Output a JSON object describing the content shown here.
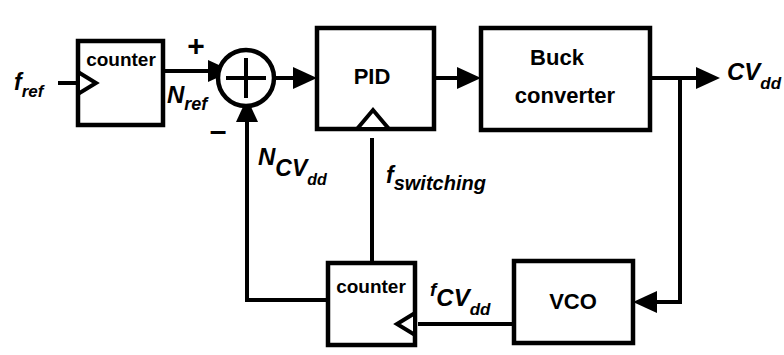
{
  "diagram": {
    "stroke_color": "#000000",
    "background_color": "#ffffff",
    "blocks": [
      {
        "id": "counter_ref",
        "label": "counter",
        "x": 78,
        "y": 41,
        "w": 85,
        "h": 84
      },
      {
        "id": "pid",
        "label": "PID",
        "x": 317,
        "y": 28,
        "w": 117,
        "h": 101
      },
      {
        "id": "buck",
        "label_line1": "Buck",
        "label_line2": "converter",
        "x": 481,
        "y": 28,
        "w": 169,
        "h": 102
      },
      {
        "id": "counter_fb",
        "label": "counter",
        "x": 328,
        "y": 263,
        "w": 87,
        "h": 82
      },
      {
        "id": "vco",
        "label": "VCO",
        "x": 514,
        "y": 261,
        "w": 119,
        "h": 82
      }
    ],
    "summing_junction": {
      "id": "sum",
      "cx": 246,
      "cy": 78,
      "r": 28,
      "operator": "+",
      "plus_sign": "+",
      "minus_sign": "–"
    },
    "signals": [
      {
        "id": "f_ref",
        "base": "f",
        "sub": "ref",
        "sub2": ""
      },
      {
        "id": "N_ref",
        "base": "N",
        "sub": "ref",
        "sub2": ""
      },
      {
        "id": "N_CVdd",
        "base": "N",
        "sub": "CV",
        "sub2": "dd"
      },
      {
        "id": "f_switching",
        "base": "f",
        "sub": "switching",
        "sub2": ""
      },
      {
        "id": "CV_dd",
        "base": "CV",
        "sub": "dd",
        "sub2": ""
      },
      {
        "id": "f_CVdd",
        "base": "f",
        "sub": "CV",
        "sub2": "dd"
      }
    ]
  }
}
